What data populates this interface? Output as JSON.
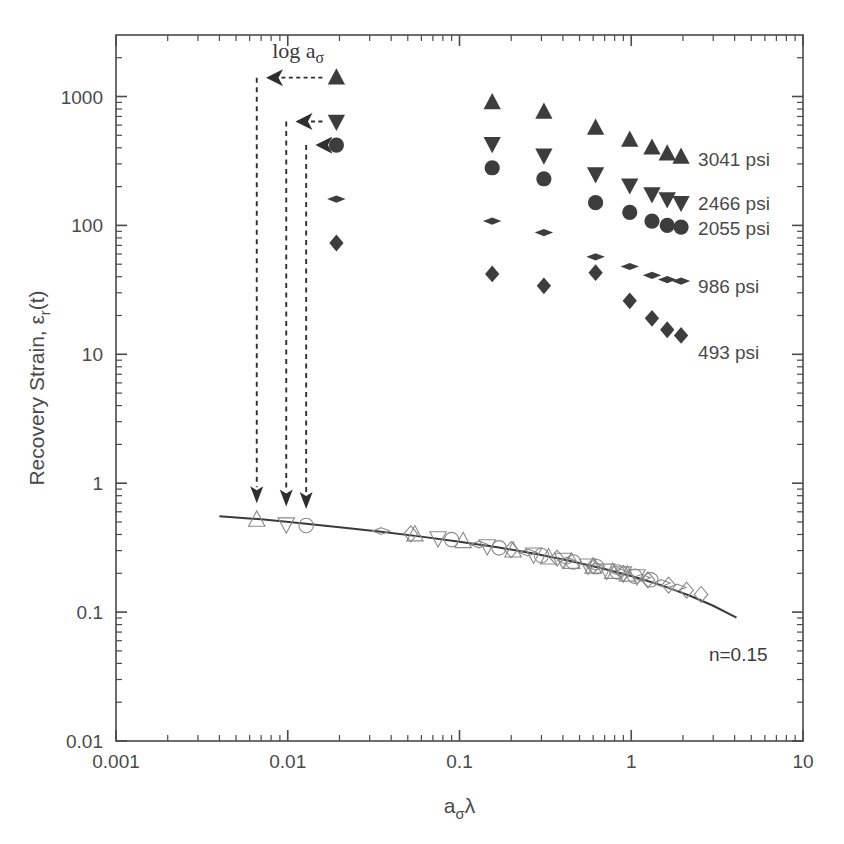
{
  "chart_data": {
    "type": "scatter",
    "title": "",
    "xlabel": "aσλ",
    "xlabel_parts": {
      "base": "a",
      "sub": "σ",
      "tail": "λ"
    },
    "ylabel": "Recovery Strain, εr(t)",
    "ylabel_parts": {
      "lead": "Recovery Strain, ",
      "eps": "ε",
      "sub": "r",
      "tail": "(t)"
    },
    "xscale": "log",
    "yscale": "log",
    "xlim": [
      0.001,
      10
    ],
    "ylim": [
      0.01,
      3000
    ],
    "grid": false,
    "legend_position": "right-inline",
    "x_ticks": [
      "0.001",
      "0.01",
      "0.1",
      "1",
      "10"
    ],
    "x_tick_values": [
      0.001,
      0.01,
      0.1,
      1,
      10
    ],
    "y_ticks": [
      "0.01",
      "0.1",
      "1",
      "10",
      "100",
      "1000"
    ],
    "y_tick_values": [
      0.01,
      0.1,
      1,
      10,
      100,
      1000
    ],
    "annotations": [
      {
        "name": "shift-factor-label",
        "text": "log aσ",
        "x": 0.0115,
        "y": 2000
      },
      {
        "name": "slope-label",
        "text": "n=0.15",
        "x": 4.2,
        "y": 0.042
      }
    ],
    "series": [
      {
        "name": "3041 psi",
        "label": "3041 psi",
        "marker": "triangle-up",
        "fill": "filled",
        "color": "#3d3d3d",
        "label_x": 2.45,
        "label_y": 330,
        "points": [
          {
            "x": 0.0192,
            "y": 1400
          },
          {
            "x": 0.155,
            "y": 900
          },
          {
            "x": 0.31,
            "y": 760
          },
          {
            "x": 0.62,
            "y": 570
          },
          {
            "x": 0.98,
            "y": 460
          },
          {
            "x": 1.32,
            "y": 400
          },
          {
            "x": 1.62,
            "y": 360
          },
          {
            "x": 1.95,
            "y": 340
          }
        ]
      },
      {
        "name": "2466 psi",
        "label": "2466 psi",
        "marker": "triangle-down",
        "fill": "filled",
        "color": "#3d3d3d",
        "label_x": 2.45,
        "label_y": 150,
        "points": [
          {
            "x": 0.0192,
            "y": 640
          },
          {
            "x": 0.155,
            "y": 430
          },
          {
            "x": 0.31,
            "y": 350
          },
          {
            "x": 0.62,
            "y": 250
          },
          {
            "x": 0.98,
            "y": 205
          },
          {
            "x": 1.32,
            "y": 175
          },
          {
            "x": 1.62,
            "y": 160
          },
          {
            "x": 1.95,
            "y": 150
          }
        ]
      },
      {
        "name": "2055 psi",
        "label": "2055 psi",
        "marker": "circle",
        "fill": "filled",
        "color": "#3d3d3d",
        "label_x": 2.45,
        "label_y": 96,
        "points": [
          {
            "x": 0.0192,
            "y": 420
          },
          {
            "x": 0.155,
            "y": 280
          },
          {
            "x": 0.31,
            "y": 230
          },
          {
            "x": 0.62,
            "y": 150
          },
          {
            "x": 0.98,
            "y": 126
          },
          {
            "x": 1.32,
            "y": 108
          },
          {
            "x": 1.62,
            "y": 100
          },
          {
            "x": 1.95,
            "y": 97
          }
        ]
      },
      {
        "name": "986 psi",
        "label": "986 psi",
        "marker": "thin-diamond",
        "fill": "filled",
        "color": "#3d3d3d",
        "label_x": 2.45,
        "label_y": 34,
        "points": [
          {
            "x": 0.0192,
            "y": 160
          },
          {
            "x": 0.155,
            "y": 108
          },
          {
            "x": 0.31,
            "y": 88
          },
          {
            "x": 0.62,
            "y": 57
          },
          {
            "x": 0.98,
            "y": 48
          },
          {
            "x": 1.32,
            "y": 41
          },
          {
            "x": 1.62,
            "y": 38
          },
          {
            "x": 1.95,
            "y": 37
          }
        ]
      },
      {
        "name": "493 psi",
        "label": "493 psi",
        "marker": "diamond",
        "fill": "filled",
        "color": "#3d3d3d",
        "label_x": 2.45,
        "label_y": 10.5,
        "points": [
          {
            "x": 0.0192,
            "y": 73
          },
          {
            "x": 0.155,
            "y": 42
          },
          {
            "x": 0.31,
            "y": 34
          },
          {
            "x": 0.62,
            "y": 43
          },
          {
            "x": 0.98,
            "y": 26
          },
          {
            "x": 1.32,
            "y": 19
          },
          {
            "x": 1.62,
            "y": 15.5
          },
          {
            "x": 1.95,
            "y": 14
          }
        ]
      },
      {
        "name": "master-curve-3041",
        "label": "",
        "marker": "triangle-up",
        "fill": "open",
        "color": "#8a8a8a",
        "points": [
          {
            "x": 0.0066,
            "y": 0.52
          },
          {
            "x": 0.055,
            "y": 0.4
          },
          {
            "x": 0.105,
            "y": 0.355
          },
          {
            "x": 0.205,
            "y": 0.3
          },
          {
            "x": 0.33,
            "y": 0.265
          },
          {
            "x": 0.45,
            "y": 0.245
          },
          {
            "x": 0.6,
            "y": 0.225
          },
          {
            "x": 0.78,
            "y": 0.205
          },
          {
            "x": 0.95,
            "y": 0.195
          }
        ]
      },
      {
        "name": "master-curve-2466",
        "label": "",
        "marker": "triangle-down",
        "fill": "open",
        "color": "#8a8a8a",
        "points": [
          {
            "x": 0.0098,
            "y": 0.48
          },
          {
            "x": 0.075,
            "y": 0.375
          },
          {
            "x": 0.145,
            "y": 0.325
          },
          {
            "x": 0.27,
            "y": 0.28
          },
          {
            "x": 0.4,
            "y": 0.255
          },
          {
            "x": 0.56,
            "y": 0.23
          },
          {
            "x": 0.72,
            "y": 0.21
          },
          {
            "x": 0.9,
            "y": 0.2
          },
          {
            "x": 1.08,
            "y": 0.19
          }
        ]
      },
      {
        "name": "master-curve-2055",
        "label": "",
        "marker": "circle",
        "fill": "open",
        "color": "#8a8a8a",
        "points": [
          {
            "x": 0.0128,
            "y": 0.47
          },
          {
            "x": 0.09,
            "y": 0.365
          },
          {
            "x": 0.17,
            "y": 0.315
          },
          {
            "x": 0.3,
            "y": 0.275
          },
          {
            "x": 0.46,
            "y": 0.245
          },
          {
            "x": 0.63,
            "y": 0.225
          },
          {
            "x": 0.83,
            "y": 0.205
          },
          {
            "x": 1.05,
            "y": 0.19
          },
          {
            "x": 1.3,
            "y": 0.178
          }
        ]
      },
      {
        "name": "master-curve-986",
        "label": "",
        "marker": "thin-diamond",
        "fill": "open",
        "color": "#8a8a8a",
        "points": [
          {
            "x": 0.035,
            "y": 0.425
          },
          {
            "x": 0.13,
            "y": 0.335
          },
          {
            "x": 0.25,
            "y": 0.29
          },
          {
            "x": 0.42,
            "y": 0.25
          },
          {
            "x": 0.62,
            "y": 0.225
          },
          {
            "x": 0.85,
            "y": 0.205
          },
          {
            "x": 1.15,
            "y": 0.185
          },
          {
            "x": 1.5,
            "y": 0.168
          },
          {
            "x": 1.85,
            "y": 0.155
          }
        ]
      },
      {
        "name": "master-curve-493",
        "label": "",
        "marker": "diamond",
        "fill": "open",
        "color": "#8a8a8a",
        "points": [
          {
            "x": 0.052,
            "y": 0.405
          },
          {
            "x": 0.2,
            "y": 0.305
          },
          {
            "x": 0.37,
            "y": 0.262
          },
          {
            "x": 0.6,
            "y": 0.228
          },
          {
            "x": 0.9,
            "y": 0.2
          },
          {
            "x": 1.25,
            "y": 0.178
          },
          {
            "x": 1.65,
            "y": 0.162
          },
          {
            "x": 2.1,
            "y": 0.148
          },
          {
            "x": 2.55,
            "y": 0.137
          }
        ]
      }
    ],
    "fit_curve": {
      "name": "power-law-fit",
      "n": 0.15,
      "label": "n=0.15",
      "color": "#3a3a3a",
      "points": [
        {
          "x": 0.004,
          "y": 0.555
        },
        {
          "x": 0.007,
          "y": 0.525
        },
        {
          "x": 0.012,
          "y": 0.49
        },
        {
          "x": 0.02,
          "y": 0.455
        },
        {
          "x": 0.035,
          "y": 0.42
        },
        {
          "x": 0.06,
          "y": 0.385
        },
        {
          "x": 0.1,
          "y": 0.352
        },
        {
          "x": 0.17,
          "y": 0.317
        },
        {
          "x": 0.28,
          "y": 0.282
        },
        {
          "x": 0.45,
          "y": 0.248
        },
        {
          "x": 0.7,
          "y": 0.216
        },
        {
          "x": 1.05,
          "y": 0.187
        },
        {
          "x": 1.55,
          "y": 0.159
        },
        {
          "x": 2.2,
          "y": 0.134
        },
        {
          "x": 3.0,
          "y": 0.112
        },
        {
          "x": 4.1,
          "y": 0.0905
        }
      ]
    },
    "shift_arrows": [
      {
        "name": "shift-arrow-3041",
        "from_x": 0.0192,
        "from_y": 1400,
        "corner_x": 0.0066,
        "to_y": 0.7
      },
      {
        "name": "shift-arrow-2466",
        "from_x": 0.0192,
        "from_y": 640,
        "corner_x": 0.0098,
        "to_y": 0.66
      },
      {
        "name": "shift-arrow-2055",
        "from_x": 0.0192,
        "from_y": 420,
        "corner_x": 0.0128,
        "to_y": 0.63
      }
    ]
  }
}
